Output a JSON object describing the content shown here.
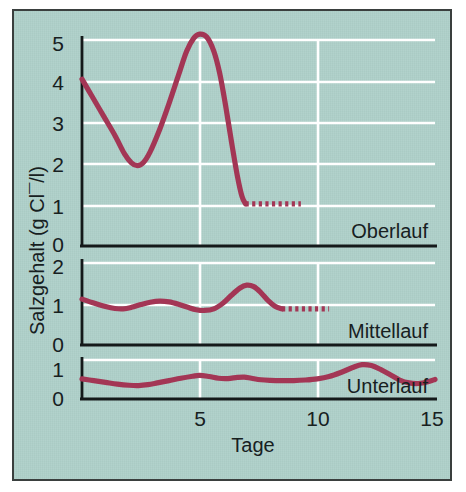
{
  "figure": {
    "background_color": "#aed0c9",
    "border_color": "#3a3f3e",
    "line_color": "#a33655",
    "grid_color": "#ffffff",
    "axis_color": "#14191a"
  },
  "axes": {
    "y_axis_title": "Salzgehalt (g Cl¯/l)",
    "x_axis_title": "Tage",
    "x_ticks": [
      "5",
      "10",
      "15"
    ],
    "x_tick_values": [
      5,
      10,
      15
    ],
    "x_range": [
      0,
      15
    ]
  },
  "panels": [
    {
      "label": "Oberlauf",
      "y_ticks": [
        "0",
        "1",
        "2",
        "3",
        "4",
        "5"
      ],
      "y_tick_values": [
        0,
        1,
        2,
        3,
        4,
        5
      ],
      "y_range": [
        0,
        5.6
      ]
    },
    {
      "label": "Mittellauf",
      "y_ticks": [
        "0",
        "1",
        "2"
      ],
      "y_tick_values": [
        0,
        1,
        2
      ],
      "y_range": [
        0,
        2.2
      ]
    },
    {
      "label": "Unterlauf",
      "y_ticks": [
        "0",
        "1"
      ],
      "y_tick_values": [
        0,
        1
      ],
      "y_range": [
        0,
        1.3
      ]
    }
  ],
  "chart_data": {
    "type": "line",
    "title": "",
    "xlabel": "Tage",
    "ylabel": "Salzgehalt (g Cl¯/l)",
    "xlim": [
      0,
      15
    ],
    "grid": true,
    "legend": "none",
    "panels": [
      {
        "name": "Oberlauf",
        "ylim": [
          0,
          5.6
        ],
        "yticks": [
          0,
          1,
          2,
          3,
          4,
          5
        ],
        "series": [
          {
            "name": "Oberlauf-measured",
            "style": "solid",
            "x": [
              0.0,
              0.4,
              0.9,
              1.4,
              1.8,
              2.1,
              2.35,
              2.6,
              2.9,
              3.3,
              3.7,
              4.1,
              4.45,
              4.75,
              5.0,
              5.3,
              5.6,
              5.85,
              6.1,
              6.35,
              6.6,
              6.8,
              6.95
            ],
            "y": [
              4.1,
              3.7,
              3.2,
              2.7,
              2.25,
              2.02,
              1.95,
              2.02,
              2.3,
              2.85,
              3.5,
              4.2,
              4.8,
              5.12,
              5.22,
              5.15,
              4.8,
              4.25,
              3.45,
              2.55,
              1.7,
              1.18,
              1.0
            ]
          },
          {
            "name": "Oberlauf-projected",
            "style": "dotted",
            "x": [
              6.95,
              9.3
            ],
            "y": [
              1.0,
              1.0
            ]
          }
        ]
      },
      {
        "name": "Mittellauf",
        "ylim": [
          0,
          2.2
        ],
        "yticks": [
          0,
          1,
          2
        ],
        "series": [
          {
            "name": "Mittellauf-measured",
            "style": "solid",
            "x": [
              0.0,
              0.5,
              1.0,
              1.4,
              1.75,
              2.1,
              2.5,
              2.9,
              3.3,
              3.7,
              4.1,
              4.5,
              4.85,
              5.2,
              5.6,
              6.0,
              6.35,
              6.7,
              7.0,
              7.3,
              7.6,
              7.9,
              8.2,
              8.5
            ],
            "y": [
              1.15,
              1.05,
              0.96,
              0.91,
              0.9,
              0.94,
              1.01,
              1.07,
              1.1,
              1.08,
              1.02,
              0.94,
              0.88,
              0.86,
              0.9,
              1.05,
              1.25,
              1.43,
              1.51,
              1.47,
              1.32,
              1.12,
              0.97,
              0.9
            ]
          },
          {
            "name": "Mittellauf-projected",
            "style": "dotted",
            "x": [
              8.5,
              10.5
            ],
            "y": [
              0.9,
              0.9
            ]
          }
        ]
      },
      {
        "name": "Unterlauf",
        "ylim": [
          0,
          1.3
        ],
        "yticks": [
          0,
          1
        ],
        "series": [
          {
            "name": "Unterlauf-measured",
            "style": "solid",
            "x": [
              0.0,
              0.5,
              1.0,
              1.5,
              2.0,
              2.4,
              2.8,
              3.2,
              3.7,
              4.2,
              4.7,
              5.0,
              5.4,
              5.8,
              6.2,
              6.6,
              6.9,
              7.2,
              7.6,
              8.0,
              8.5,
              9.0,
              9.5,
              10.0,
              10.5,
              11.0,
              11.5,
              11.9,
              12.3,
              12.7,
              13.1,
              13.5,
              13.9,
              14.3,
              14.7,
              15.0
            ],
            "y": [
              0.66,
              0.6,
              0.54,
              0.48,
              0.44,
              0.43,
              0.46,
              0.52,
              0.6,
              0.68,
              0.75,
              0.78,
              0.74,
              0.68,
              0.67,
              0.71,
              0.72,
              0.68,
              0.63,
              0.61,
              0.6,
              0.6,
              0.62,
              0.66,
              0.74,
              0.88,
              1.05,
              1.15,
              1.12,
              0.98,
              0.8,
              0.62,
              0.52,
              0.5,
              0.56,
              0.64
            ]
          }
        ]
      }
    ]
  }
}
